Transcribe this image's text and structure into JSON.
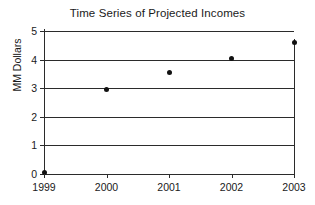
{
  "chart_data": {
    "type": "scatter",
    "title": "Time Series of Projected Incomes",
    "xlabel": "",
    "ylabel": "MM Dollars",
    "categories": [
      "1999",
      "2000",
      "2001",
      "2002",
      "2003"
    ],
    "x": [
      1999,
      2000,
      2001,
      2002,
      2003
    ],
    "values": [
      0.05,
      2.95,
      3.55,
      4.05,
      4.6
    ],
    "series": [
      {
        "name": "Projected Income",
        "values": [
          0.05,
          2.95,
          3.55,
          4.05,
          4.6
        ]
      }
    ],
    "ylim": [
      0,
      5
    ],
    "xlim": [
      1999,
      2003
    ],
    "y_ticks": [
      0,
      1,
      2,
      3,
      4,
      5
    ],
    "y_tick_labels": [
      "0",
      "1",
      "2",
      "3",
      "4",
      "5"
    ],
    "x_ticks": [
      1999,
      2000,
      2001,
      2002,
      2003
    ],
    "x_tick_labels": [
      "1999",
      "2000",
      "2001",
      "2002",
      "2003"
    ],
    "grid": true,
    "grid_axis": "y",
    "legend": false,
    "legend_position": "none",
    "marker": "filled-circle",
    "marker_color": "#111111",
    "gridline_color": "#2b2b2b",
    "axis_color": "#2b2b2b",
    "background_color": "#ffffff"
  }
}
